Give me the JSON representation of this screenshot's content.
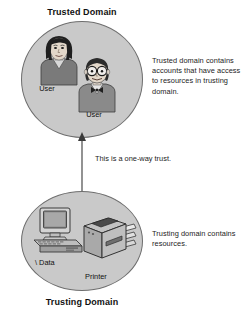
{
  "diagram": {
    "title_top": "Trusted Domain",
    "title_bottom": "Trusting Domain",
    "note_top": "Trusted domain contains accounts that have access to resources in trusting domain.",
    "note_bottom": "Trusting domain contains resources.",
    "trust_label": "This is a one-way trust.",
    "labels": {
      "user_1": "User",
      "user_2": "User",
      "data": "\\ Data",
      "printer": "Printer"
    },
    "colors": {
      "circle_fill": "#c9c9c9",
      "circle_stroke": "#6e6e6e",
      "text": "#1c1c1c",
      "background": "#ffffff",
      "arrow": "#3a3a3a"
    },
    "icons": {
      "person_1": "person-female-icon",
      "person_2": "person-male-glasses-icon",
      "computer": "desktop-computer-icon",
      "printer": "printer-icon",
      "arrow": "up-arrow-icon"
    }
  }
}
